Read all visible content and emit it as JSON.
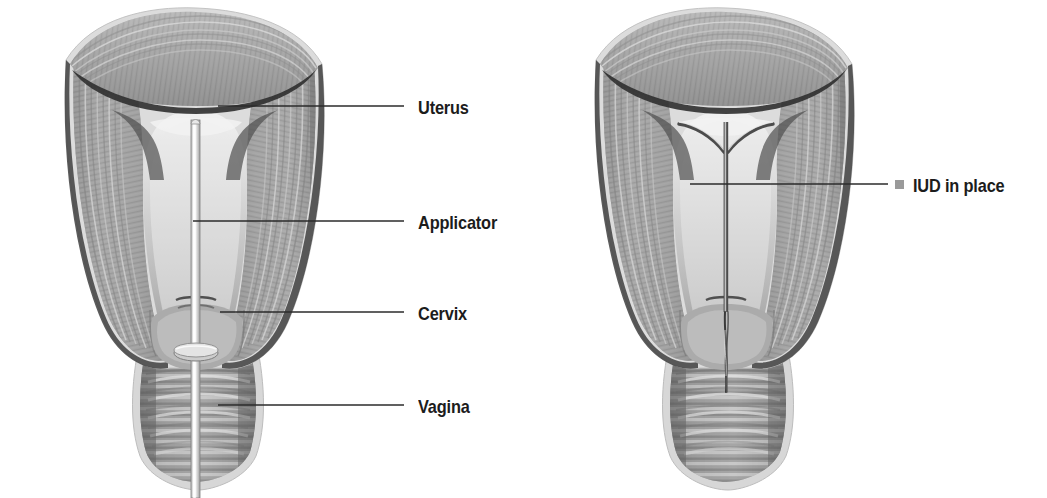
{
  "figure": {
    "background_color": "#ffffff",
    "line_color": "#2b2b2b",
    "label_color": "#1c1c1c",
    "tissue_fill": "#9d9d9d",
    "tissue_light": "#d2d2d2",
    "tissue_dark": "#4a4a4a",
    "cavity_fill": "#e3e3e3",
    "device_color": "#f0f0f0"
  },
  "panels": [
    {
      "id": "left-panel",
      "name": "iud-insertion-diagram",
      "description": "Coronal cross-section of uterus, cervix and vagina with IUD applicator inserted through the cervical canal",
      "labels": [
        {
          "id": "uterus",
          "text": "Uterus",
          "text_x": 418,
          "text_y": 98,
          "leader_x1": 218,
          "leader_y1": 106,
          "leader_x2": 404,
          "leader_y2": 106
        },
        {
          "id": "applicator",
          "text": "Applicator",
          "text_x": 418,
          "text_y": 213,
          "leader_x1": 193,
          "leader_y1": 221,
          "leader_x2": 404,
          "leader_y2": 221
        },
        {
          "id": "cervix",
          "text": "Cervix",
          "text_x": 418,
          "text_y": 304,
          "leader_x1": 220,
          "leader_y1": 312,
          "leader_x2": 404,
          "leader_y2": 312
        },
        {
          "id": "vagina",
          "text": "Vagina",
          "text_x": 418,
          "text_y": 397,
          "leader_x1": 218,
          "leader_y1": 405,
          "leader_x2": 404,
          "leader_y2": 405
        }
      ]
    },
    {
      "id": "right-panel",
      "name": "iud-in-place-diagram",
      "description": "Coronal cross-section of uterus with T-shaped IUD seated in the uterine cavity and strings trailing through the cervix",
      "labels": [
        {
          "id": "iud-in-place",
          "text": "IUD in place",
          "text_x": 913,
          "text_y": 176,
          "leader_x1": 690,
          "leader_y1": 184,
          "leader_x2": 888,
          "leader_y2": 184,
          "swatch_x": 895,
          "swatch_y": 180
        }
      ]
    }
  ],
  "legend": {
    "swatch_color": "#9a9a9a",
    "swatch_label": "IUD in place"
  }
}
